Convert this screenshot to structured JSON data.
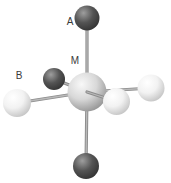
{
  "colors": {
    "background": "#ffffff",
    "dark_atom": {
      "highlight": "#9e9e9e",
      "body": "#545454",
      "edge": "#303030"
    },
    "light_atom": {
      "highlight": "#ffffff",
      "body": "#f2f2f2",
      "edge": "#c0c0c0"
    },
    "central_atom": {
      "highlight": "#f8f8f8",
      "body": "#d8d8d8",
      "edge": "#8e8e8e"
    },
    "bond_outer": "#8c8c8c",
    "bond_inner": "#b9b9b9",
    "label_text": "#3a3a3a"
  },
  "atoms": [
    {
      "id": "back",
      "type": "dark",
      "x": 54,
      "y": 79,
      "r": 11,
      "layer": 2
    },
    {
      "id": "central",
      "type": "central",
      "x": 87,
      "y": 92,
      "r": 19.5,
      "layer": 4
    },
    {
      "id": "top",
      "type": "dark",
      "x": 87,
      "y": 18,
      "r": 12.5,
      "layer": 6
    },
    {
      "id": "bottom",
      "type": "dark",
      "x": 86,
      "y": 166,
      "r": 13,
      "layer": 6
    },
    {
      "id": "left",
      "type": "light",
      "x": 17,
      "y": 103,
      "r": 14,
      "layer": 6
    },
    {
      "id": "right",
      "type": "light",
      "x": 151,
      "y": 88,
      "r": 13.5,
      "layer": 6
    },
    {
      "id": "front",
      "type": "light",
      "x": 116.5,
      "y": 101.5,
      "r": 13.5,
      "layer": 6
    }
  ],
  "bonds": [
    {
      "from": "central",
      "to": "back",
      "layer": 1
    },
    {
      "from": "central",
      "to": "top",
      "layer": 3
    },
    {
      "from": "central",
      "to": "bottom",
      "layer": 3
    },
    {
      "from": "central",
      "to": "left",
      "layer": 3
    },
    {
      "from": "central",
      "to": "right",
      "layer": 3
    },
    {
      "from": "central",
      "to": "front",
      "layer": 5
    }
  ],
  "text_labels": [
    {
      "text": "A",
      "x": 70,
      "y": 25
    },
    {
      "text": "B",
      "x": 19,
      "y": 79
    },
    {
      "text": "M",
      "x": 75,
      "y": 64
    }
  ]
}
